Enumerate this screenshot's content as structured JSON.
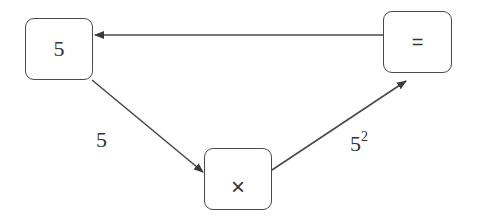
{
  "nodes": {
    "input": {
      "label": "5"
    },
    "multiply": {
      "label": "×"
    },
    "equals": {
      "label": "="
    }
  },
  "edges": {
    "input_to_multiply": {
      "label": "5"
    },
    "multiply_to_equals": {
      "base": "5",
      "exponent": "2"
    },
    "equals_to_input": {
      "label": ""
    }
  },
  "colors": {
    "stroke": "#4a4a4a",
    "text": "#333333",
    "background": "#ffffff"
  }
}
